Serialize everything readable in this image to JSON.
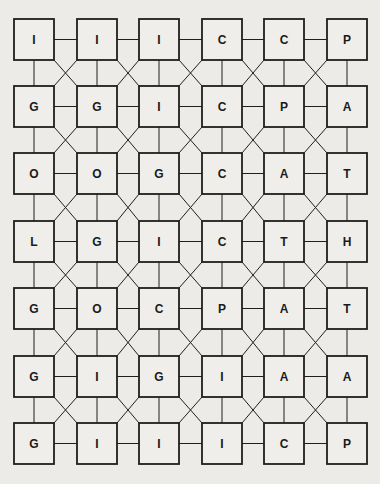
{
  "puzzle": {
    "type": "letter-grid",
    "columns": 6,
    "rows": 7,
    "colors": {
      "background": "#ecebe8",
      "box_fill": "#efeeeb",
      "line": "#1e1e1e",
      "text": "#1a1a1a"
    },
    "layout": {
      "col_x": [
        14,
        77,
        139,
        202,
        264,
        327
      ],
      "row_y": [
        19,
        86,
        153,
        221,
        288,
        356,
        423
      ],
      "box_w": 40,
      "box_h": 41
    },
    "grid": [
      [
        "I",
        "I",
        "I",
        "C",
        "C",
        "P"
      ],
      [
        "G",
        "G",
        "I",
        "C",
        "P",
        "A"
      ],
      [
        "O",
        "O",
        "G",
        "C",
        "A",
        "T"
      ],
      [
        "L",
        "G",
        "I",
        "C",
        "T",
        "H"
      ],
      [
        "G",
        "O",
        "C",
        "P",
        "A",
        "T"
      ],
      [
        "G",
        "I",
        "G",
        "I",
        "A",
        "A"
      ],
      [
        "G",
        "I",
        "I",
        "I",
        "C",
        "P"
      ]
    ],
    "connections": {
      "horizontal": "between every pair of adjacent boxes in a row",
      "vertical": "between every pair of adjacent boxes in a column",
      "diagonal": "X-crossing between every 2x2 block of boxes"
    }
  }
}
